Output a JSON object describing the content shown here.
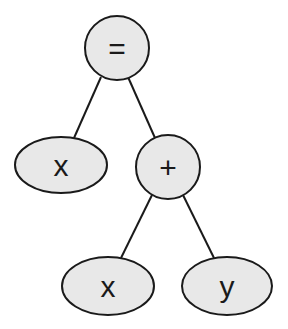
{
  "diagram": {
    "type": "expression-tree",
    "background": "#ffffff",
    "node_fill": "#e8e8e8",
    "stroke_color": "#1a1a1a",
    "nodes": [
      {
        "id": "root",
        "label": "=",
        "shape": "circle",
        "cx": 117,
        "cy": 48,
        "rx": 32,
        "ry": 32
      },
      {
        "id": "left_x",
        "label": "x",
        "shape": "ellipse",
        "cx": 61,
        "cy": 165,
        "rx": 46,
        "ry": 28
      },
      {
        "id": "plus",
        "label": "+",
        "shape": "circle",
        "cx": 168,
        "cy": 167,
        "rx": 32,
        "ry": 32
      },
      {
        "id": "bottom_x",
        "label": "x",
        "shape": "ellipse",
        "cx": 108,
        "cy": 286,
        "rx": 46,
        "ry": 29
      },
      {
        "id": "bottom_y",
        "label": "y",
        "shape": "ellipse",
        "cx": 227,
        "cy": 286,
        "rx": 45,
        "ry": 29
      }
    ],
    "edges": [
      {
        "from": "root",
        "to": "left_x",
        "x1": 101,
        "y1": 77,
        "x2": 74,
        "y2": 138
      },
      {
        "from": "root",
        "to": "plus",
        "x1": 128,
        "y1": 77,
        "x2": 155,
        "y2": 138
      },
      {
        "from": "plus",
        "to": "bottom_x",
        "x1": 152,
        "y1": 195,
        "x2": 121,
        "y2": 258
      },
      {
        "from": "plus",
        "to": "bottom_y",
        "x1": 183,
        "y1": 195,
        "x2": 214,
        "y2": 258
      }
    ]
  }
}
